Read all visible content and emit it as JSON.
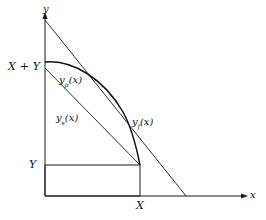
{
  "figure": {
    "type": "mathematical-diagram",
    "background_color": "#ffffff",
    "stroke_color": "#1a1a1a",
    "axes": {
      "y_axis_label": "y",
      "x_axis_label": "x",
      "origin_px": [
        45,
        196
      ],
      "y_axis_top_px": [
        45,
        16
      ],
      "x_axis_right_px": [
        248,
        196
      ]
    },
    "tick_labels": {
      "y_upper": "X + Y",
      "y_upper_parts": {
        "first": "X",
        "operator": "+",
        "second": "Y"
      },
      "y_lower": "Y",
      "x_right": "X"
    },
    "curves": [
      {
        "name": "yp",
        "label": "y",
        "subscript": "p",
        "argument": "(x)",
        "display": "y_p(x)",
        "kind": "curve",
        "description": "concave curve bulging outward from (0, X+Y) to (X, Y)",
        "start_px": [
          45,
          62
        ],
        "end_px": [
          140,
          165
        ],
        "control_px": [
          108,
          66
        ]
      },
      {
        "name": "ys",
        "label": "y",
        "subscript": "s",
        "argument": "(x)",
        "display": "y_s(x)",
        "kind": "straight-line",
        "description": "straight chord from (0, X+Y) to (X, Y)",
        "start_px": [
          45,
          68
        ],
        "end_px": [
          140,
          165
        ]
      },
      {
        "name": "yf",
        "label": "y",
        "subscript": "f",
        "argument": "(x)",
        "display": "y_f(x)",
        "kind": "straight-line",
        "description": "straight line from high on y-axis down through the x-axis",
        "start_px": [
          45,
          20
        ],
        "end_px": [
          186,
          196
        ]
      }
    ],
    "rectangle": {
      "name": "reference-rectangle",
      "left_px": 45,
      "right_px": 140,
      "top_px": 165,
      "bottom_px": 196
    }
  }
}
